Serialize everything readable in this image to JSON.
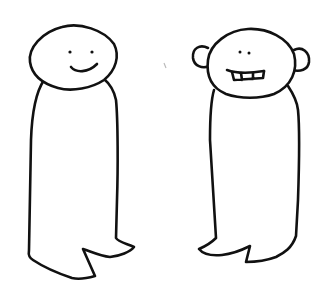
{
  "drawing": {
    "description": "Hand-drawn line sketch of two simple standing figures",
    "background": "#ffffff",
    "ink_color": "#111111",
    "figures": [
      {
        "id": "left",
        "label": "smiling figure",
        "features": [
          "round head",
          "two dot eyes",
          "smile mouth",
          "tall body",
          "two feet"
        ]
      },
      {
        "id": "right",
        "label": "figure with ears and teeth",
        "features": [
          "round head",
          "two ears",
          "two dot eyes",
          "toothy grin",
          "tall body",
          "two feet"
        ]
      }
    ]
  }
}
